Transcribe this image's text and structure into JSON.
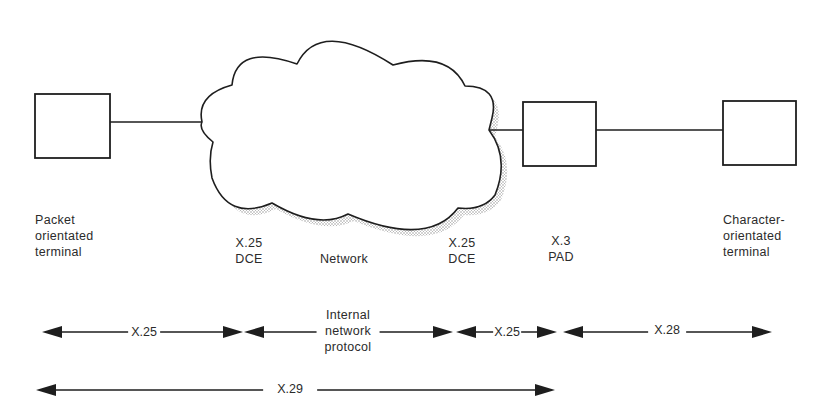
{
  "diagram": {
    "nodes": {
      "packet_terminal": {
        "lines": [
          "Packet",
          "orientated",
          "terminal"
        ]
      },
      "dce_left": {
        "lines": [
          "X.25",
          "DCE"
        ]
      },
      "network": {
        "label": "Network"
      },
      "dce_right": {
        "lines": [
          "X.25",
          "DCE"
        ]
      },
      "pad": {
        "lines": [
          "X.3",
          "PAD"
        ]
      },
      "char_terminal": {
        "lines": [
          "Character-",
          "orientated",
          "terminal"
        ]
      }
    },
    "protocol_spans": [
      {
        "label": "X.25",
        "from": "packet_terminal",
        "to": "dce_left"
      },
      {
        "label_lines": [
          "Internal",
          "network",
          "protocol"
        ],
        "from": "dce_left",
        "to": "dce_right"
      },
      {
        "label": "X.25",
        "from": "dce_right",
        "to": "pad"
      },
      {
        "label": "X.28",
        "from": "pad",
        "to": "char_terminal"
      },
      {
        "label": "X.29",
        "from": "packet_terminal",
        "to": "pad"
      }
    ],
    "colors": {
      "stroke": "#1e1e1e",
      "text": "#2b2b2b",
      "shadow": "#9a9a9a",
      "background": "#ffffff"
    }
  }
}
